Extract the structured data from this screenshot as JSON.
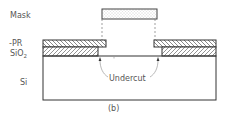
{
  "diagram": {
    "type": "cross-section",
    "caption": "(b)",
    "labels": {
      "mask": "Mask",
      "pr": "-PR",
      "sio2_main": "SiO",
      "sio2_sub": "2",
      "si": "Si",
      "undercut": "Undercut"
    },
    "layers": [
      {
        "name": "Mask",
        "fill": "stipple"
      },
      {
        "name": "PR",
        "fill": "hatch-backslash"
      },
      {
        "name": "SiO2",
        "fill": "hatch-slash"
      },
      {
        "name": "Si",
        "fill": "none"
      }
    ],
    "colors": {
      "stroke": "#333333",
      "text": "#555555",
      "background": "#ffffff"
    }
  }
}
